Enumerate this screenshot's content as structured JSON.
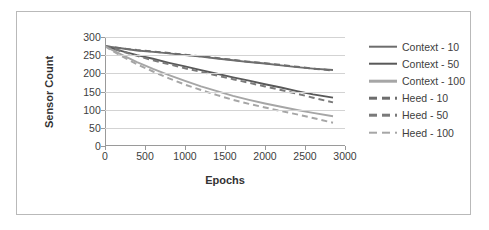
{
  "chart_data": {
    "type": "line",
    "title": "",
    "xlabel": "Epochs",
    "ylabel": "Sensor Count",
    "xlim": [
      0,
      3000
    ],
    "ylim": [
      0,
      300
    ],
    "xticks": [
      0,
      500,
      1000,
      1500,
      2000,
      2500,
      3000
    ],
    "yticks": [
      0,
      50,
      100,
      150,
      200,
      250,
      300
    ],
    "grid": "horizontal",
    "legend_position": "right",
    "x": [
      0,
      100,
      200,
      400,
      600,
      800,
      1000,
      1200,
      1400,
      1600,
      1800,
      2000,
      2200,
      2400,
      2600,
      2850
    ],
    "series": [
      {
        "name": "Context - 10",
        "style": "solid",
        "color": "#6d6d6d",
        "values": [
          275,
          272,
          269,
          263,
          259,
          255,
          250,
          246,
          241,
          236,
          231,
          227,
          222,
          217,
          213,
          209
        ]
      },
      {
        "name": "Context - 50",
        "style": "solid",
        "color": "#595959",
        "values": [
          275,
          268,
          262,
          250,
          240,
          229,
          219,
          209,
          199,
          189,
          180,
          170,
          161,
          151,
          142,
          133
        ]
      },
      {
        "name": "Context - 100",
        "style": "solid",
        "color": "#a6a6a6",
        "values": [
          275,
          263,
          252,
          231,
          212,
          195,
          179,
          164,
          151,
          138,
          127,
          117,
          108,
          99,
          91,
          82
        ]
      },
      {
        "name": "Heed - 10",
        "style": "dashed",
        "color": "#6d6d6d",
        "values": [
          275,
          272,
          269,
          264,
          260,
          256,
          251,
          247,
          242,
          237,
          232,
          228,
          223,
          218,
          213,
          208
        ]
      },
      {
        "name": "Heed - 50",
        "style": "dashed",
        "color": "#7a7a7a",
        "values": [
          275,
          268,
          261,
          248,
          236,
          225,
          214,
          204,
          194,
          184,
          174,
          164,
          154,
          144,
          133,
          120
        ]
      },
      {
        "name": "Heed - 100",
        "style": "dashed",
        "color": "#a6a6a6",
        "values": [
          275,
          261,
          248,
          225,
          205,
          186,
          169,
          154,
          140,
          127,
          116,
          106,
          96,
          87,
          77,
          64
        ]
      }
    ]
  },
  "axes": {
    "y_title": "Sensor Count",
    "x_title": "Epochs",
    "y_tick_labels": [
      "300",
      "250",
      "200",
      "150",
      "100",
      "50",
      "0"
    ],
    "x_tick_labels": [
      "0",
      "500",
      "1000",
      "1500",
      "2000",
      "2500",
      "3000"
    ]
  },
  "legend": {
    "items": [
      {
        "label": "Context - 10",
        "style": "solid",
        "color": "#6d6d6d"
      },
      {
        "label": "Context - 50",
        "style": "solid",
        "color": "#595959"
      },
      {
        "label": "Context - 100",
        "style": "solid",
        "color": "#a6a6a6"
      },
      {
        "label": "Heed - 10",
        "style": "dashed",
        "color": "#6d6d6d"
      },
      {
        "label": "Heed - 50",
        "style": "dashed",
        "color": "#7a7a7a"
      },
      {
        "label": "Heed - 100",
        "style": "dashed",
        "color": "#a6a6a6"
      }
    ]
  },
  "colors": {
    "grid": "#d3d3d3",
    "axis": "#9a9a9a",
    "border": "#b9b9b9",
    "text": "#404040",
    "background": "#ffffff"
  }
}
